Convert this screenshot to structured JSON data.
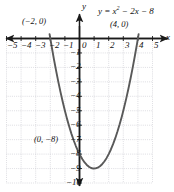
{
  "chart_data": {
    "type": "line",
    "title": "",
    "equation_label": "y = x² − 2x − 8",
    "equation_parts": {
      "lhs": "y = x",
      "exp": "2",
      "rhs": " − 2x − 8"
    },
    "function": "y = x^2 - 2x - 8",
    "xlabel": "x",
    "ylabel": "y",
    "xlim": [
      -5,
      5
    ],
    "ylim": [
      -10,
      0
    ],
    "grid": true,
    "legend": "none",
    "xticks": [
      "−5",
      "−4",
      "−3",
      "−2",
      "−1",
      "0",
      "1",
      "2",
      "3",
      "4",
      "5"
    ],
    "xtick_values": [
      -5,
      -4,
      -3,
      -2,
      -1,
      0,
      1,
      2,
      3,
      4,
      5
    ],
    "yticks": [
      "−1",
      "−2",
      "−3",
      "−4",
      "−5",
      "−6",
      "−7",
      "−8",
      "−9",
      "−10"
    ],
    "ytick_values": [
      -1,
      -2,
      -3,
      -4,
      -5,
      -6,
      -7,
      -8,
      -9,
      -10
    ],
    "annotations": [
      {
        "name": "root-left",
        "text": "(−2, 0)",
        "x": -2,
        "y": 0
      },
      {
        "name": "root-right",
        "text": "(4, 0)",
        "x": 4,
        "y": 0
      },
      {
        "name": "y-intercept",
        "text": "(0, −8)",
        "x": 0,
        "y": -8
      }
    ],
    "key_points": {
      "roots": [
        [
          -2,
          0
        ],
        [
          4,
          0
        ]
      ],
      "y_intercept": [
        0,
        -8
      ],
      "vertex": [
        1,
        -9
      ]
    },
    "series": [
      {
        "name": "parabola",
        "color": "#595959",
        "x": [
          -2.05,
          -1.9,
          -1.75,
          -1.6,
          -1.45,
          -1.3,
          -1.15,
          -1.0,
          -0.85,
          -0.7,
          -0.55,
          -0.4,
          -0.25,
          -0.1,
          0.05,
          0.2,
          0.35,
          0.5,
          0.65,
          0.8,
          0.95,
          1.1,
          1.25,
          1.4,
          1.55,
          1.7,
          1.85,
          2.0,
          2.15,
          2.3,
          2.45,
          2.6,
          2.75,
          2.9,
          3.05,
          3.2,
          3.35,
          3.5,
          3.65,
          3.8,
          3.95,
          4.05
        ],
        "y": [
          0.3,
          -0.59,
          -1.44,
          -2.24,
          -3.0,
          -3.71,
          -4.38,
          -5.0,
          -5.58,
          -6.11,
          -6.6,
          -7.04,
          -7.44,
          -7.79,
          -8.1,
          -8.36,
          -8.58,
          -8.75,
          -8.88,
          -8.96,
          -9.0,
          -8.99,
          -8.94,
          -8.84,
          -8.7,
          -8.51,
          -8.28,
          -8.0,
          -7.68,
          -7.31,
          -6.9,
          -6.44,
          -5.94,
          -5.39,
          -4.8,
          -4.16,
          -3.48,
          -2.75,
          -1.98,
          -1.16,
          -0.3,
          0.3
        ]
      }
    ],
    "axis_arrows": [
      "left",
      "right",
      "up",
      "down"
    ],
    "colors": {
      "curve": "#595959",
      "axis": "#1a1a1a",
      "grid": "#c8c8d0",
      "text": "#111111"
    }
  }
}
